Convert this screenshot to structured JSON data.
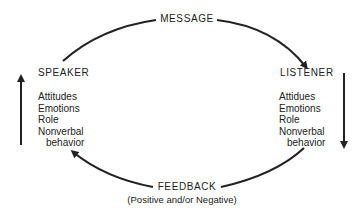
{
  "diagram": {
    "title_top": "MESSAGE",
    "feedback": {
      "label": "FEEDBACK",
      "subtitle": "(Positive and/or Negative)"
    },
    "speaker": {
      "label": "SPEAKER",
      "attributes": [
        "Attitudes",
        "Emotions",
        "Role",
        "Nonverbal",
        "behavior"
      ]
    },
    "listener": {
      "label": "LISTENER",
      "attributes": [
        "Attidues",
        "Emotions",
        "Role",
        "Nonverbal",
        "behavior"
      ]
    },
    "colors": {
      "ink": "#222222",
      "background": "#ffffff"
    }
  }
}
